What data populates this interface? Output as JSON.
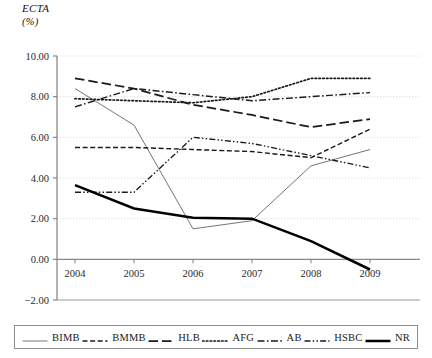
{
  "chart_data": {
    "type": "line",
    "title": "",
    "ylabel": "ECTA",
    "ylabel_unit": "(%)",
    "xlabel": "",
    "x": [
      "2004",
      "2005",
      "2006",
      "2007",
      "2008",
      "2009"
    ],
    "categories": [
      "2004",
      "2005",
      "2006",
      "2007",
      "2008",
      "2009"
    ],
    "ylim": [
      -2.0,
      10.0
    ],
    "yticks": [
      "10.00",
      "8.00",
      "6.00",
      "4.00",
      "2.00",
      "0.00",
      "-2.00"
    ],
    "ytick_values": [
      10.0,
      8.0,
      6.0,
      4.0,
      2.0,
      0.0,
      -2.0
    ],
    "grid": true,
    "grid_style": "dotted-horizontal",
    "legend_position": "bottom",
    "series": [
      {
        "name": "BIMB",
        "style": "solid-thin",
        "color": "#6e6e6e",
        "values": [
          8.4,
          6.6,
          1.5,
          1.9,
          4.6,
          5.4
        ]
      },
      {
        "name": "BMMB",
        "style": "dashed",
        "color": "#1a1a1a",
        "values": [
          5.5,
          5.5,
          5.4,
          5.3,
          5.0,
          6.4
        ]
      },
      {
        "name": "HLB",
        "style": "long-dash",
        "color": "#1a1a1a",
        "values": [
          8.9,
          8.4,
          7.6,
          7.1,
          6.5,
          6.9
        ]
      },
      {
        "name": "AFG",
        "style": "dotted",
        "color": "#1a1a1a",
        "values": [
          7.9,
          7.8,
          7.7,
          8.0,
          8.9,
          8.9
        ]
      },
      {
        "name": "AB",
        "style": "dash-dot",
        "color": "#1a1a1a",
        "values": [
          7.5,
          8.4,
          8.1,
          7.8,
          8.0,
          8.2
        ]
      },
      {
        "name": "HSBC",
        "style": "dash-dot-dot",
        "color": "#1a1a1a",
        "values": [
          3.3,
          3.3,
          6.0,
          5.7,
          5.1,
          4.5
        ]
      },
      {
        "name": "NR",
        "style": "solid-thick",
        "color": "#000000",
        "values": [
          3.65,
          2.5,
          2.05,
          2.0,
          0.9,
          -0.5
        ]
      }
    ]
  },
  "legend": {
    "items": [
      {
        "label": "BIMB"
      },
      {
        "label": "BMMB"
      },
      {
        "label": "HLB"
      },
      {
        "label": "AFG"
      },
      {
        "label": "AB"
      },
      {
        "label": "HSBC"
      },
      {
        "label": "NR"
      }
    ]
  }
}
